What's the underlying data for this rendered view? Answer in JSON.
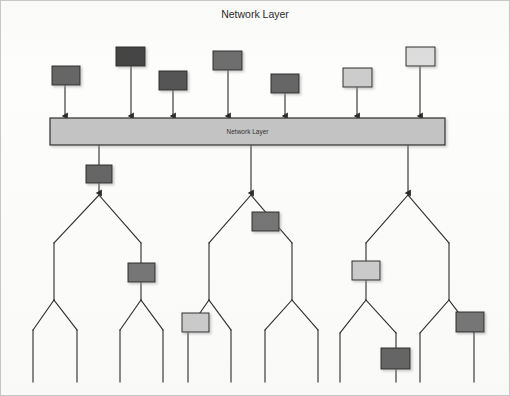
{
  "figure": {
    "title": "Network Layer",
    "type": "diagram",
    "width": 510,
    "height": 396,
    "background_color": "#fdfdfc",
    "line_color": "#2b2b2b"
  },
  "palette": {
    "darkest": "#444444",
    "dark": "#666666",
    "mid": "#7d7d7d",
    "light": "#cccccc",
    "lightest": "#dddddd",
    "bar_fill": "#c4c4c4"
  },
  "bar": {
    "label": "Network Layer",
    "x": 50,
    "y": 118,
    "width": 395,
    "height": 27,
    "fill": "#c4c4c4"
  },
  "incoming": {
    "count": 7,
    "description": "Packets arriving into the network layer",
    "nodes": [
      {
        "id": "in-1",
        "x": 52,
        "y": 66,
        "w": 28,
        "h": 19,
        "fill": "#666666",
        "arrow_x": 65,
        "arrow_to_y": 116
      },
      {
        "id": "in-2",
        "x": 116,
        "y": 47,
        "w": 29,
        "h": 19,
        "fill": "#444444",
        "arrow_x": 131,
        "arrow_to_y": 116
      },
      {
        "id": "in-3",
        "x": 159,
        "y": 71,
        "w": 28,
        "h": 19,
        "fill": "#555555",
        "arrow_x": 173,
        "arrow_to_y": 116
      },
      {
        "id": "in-4",
        "x": 213,
        "y": 51,
        "w": 29,
        "h": 19,
        "fill": "#6e6e6e",
        "arrow_x": 228,
        "arrow_to_y": 116
      },
      {
        "id": "in-5",
        "x": 271,
        "y": 74,
        "w": 28,
        "h": 19,
        "fill": "#666666",
        "arrow_x": 285,
        "arrow_to_y": 116
      },
      {
        "id": "in-6",
        "x": 343,
        "y": 68,
        "w": 29,
        "h": 19,
        "fill": "#cccccc",
        "arrow_x": 357,
        "arrow_to_y": 116
      },
      {
        "id": "in-7",
        "x": 406,
        "y": 47,
        "w": 29,
        "h": 19,
        "fill": "#dddddd",
        "arrow_x": 420,
        "arrow_to_y": 116
      }
    ]
  },
  "outgoing": {
    "count": 3,
    "description": "Three distribution trees fed from the network layer bar",
    "trunks": [
      {
        "id": "trunk-1",
        "x": 99,
        "from_y": 145,
        "to_y": 193
      },
      {
        "id": "trunk-2",
        "x": 251,
        "from_y": 145,
        "to_y": 193
      },
      {
        "id": "trunk-3",
        "x": 408,
        "from_y": 145,
        "to_y": 193
      }
    ],
    "trunk_nodes": [
      {
        "id": "trunk-node-1",
        "x": 86,
        "y": 165,
        "w": 26,
        "h": 18,
        "fill": "#666666"
      }
    ]
  },
  "trees": [
    {
      "id": "tree-1",
      "apex": {
        "x": 99,
        "y": 195
      },
      "branches": [
        {
          "from": [
            99,
            195
          ],
          "to": [
            54,
            243
          ]
        },
        {
          "from": [
            99,
            195
          ],
          "to": [
            141,
            243
          ]
        }
      ],
      "stems": [
        {
          "x": 54,
          "from_y": 243,
          "to_y": 300
        },
        {
          "x": 141,
          "from_y": 243,
          "to_y": 300
        }
      ],
      "forks": [
        {
          "from": [
            54,
            300
          ],
          "to": [
            33,
            330
          ],
          "leg_to_y": 382
        },
        {
          "from": [
            54,
            300
          ],
          "to": [
            77,
            330
          ],
          "leg_to_y": 382
        },
        {
          "from": [
            141,
            300
          ],
          "to": [
            120,
            330
          ],
          "leg_to_y": 382
        },
        {
          "from": [
            141,
            300
          ],
          "to": [
            163,
            330
          ],
          "leg_to_y": 382
        }
      ],
      "boxes": [
        {
          "id": "tree1-box-a",
          "x": 128,
          "y": 263,
          "w": 27,
          "h": 19,
          "fill": "#777777"
        }
      ]
    },
    {
      "id": "tree-2",
      "apex": {
        "x": 251,
        "y": 195
      },
      "branches": [
        {
          "from": [
            251,
            195
          ],
          "to": [
            209,
            243
          ]
        },
        {
          "from": [
            251,
            195
          ],
          "to": [
            292,
            243
          ]
        }
      ],
      "stems": [
        {
          "x": 209,
          "from_y": 243,
          "to_y": 300
        },
        {
          "x": 292,
          "from_y": 243,
          "to_y": 300
        }
      ],
      "forks": [
        {
          "from": [
            209,
            300
          ],
          "to": [
            188,
            330
          ],
          "leg_to_y": 382
        },
        {
          "from": [
            209,
            300
          ],
          "to": [
            231,
            330
          ],
          "leg_to_y": 382
        },
        {
          "from": [
            292,
            300
          ],
          "to": [
            265,
            330
          ],
          "leg_to_y": 382
        },
        {
          "from": [
            292,
            300
          ],
          "to": [
            318,
            330
          ],
          "leg_to_y": 382
        }
      ],
      "boxes": [
        {
          "id": "tree2-box-a",
          "x": 252,
          "y": 212,
          "w": 27,
          "h": 19,
          "fill": "#767676"
        },
        {
          "id": "tree2-box-b",
          "x": 182,
          "y": 313,
          "w": 27,
          "h": 19,
          "fill": "#cccccc"
        }
      ]
    },
    {
      "id": "tree-3",
      "apex": {
        "x": 408,
        "y": 195
      },
      "branches": [
        {
          "from": [
            408,
            195
          ],
          "to": [
            366,
            243
          ]
        },
        {
          "from": [
            408,
            195
          ],
          "to": [
            449,
            243
          ]
        }
      ],
      "stems": [
        {
          "x": 366,
          "from_y": 243,
          "to_y": 300
        },
        {
          "x": 449,
          "from_y": 243,
          "to_y": 300
        }
      ],
      "forks": [
        {
          "from": [
            366,
            300
          ],
          "to": [
            340,
            333
          ],
          "leg_to_y": 382
        },
        {
          "from": [
            366,
            300
          ],
          "to": [
            396,
            333
          ],
          "leg_to_y": 382
        },
        {
          "from": [
            449,
            300
          ],
          "to": [
            420,
            333
          ],
          "leg_to_y": 382
        },
        {
          "from": [
            449,
            300
          ],
          "to": [
            474,
            333
          ],
          "leg_to_y": 382
        }
      ],
      "boxes": [
        {
          "id": "tree3-box-a",
          "x": 352,
          "y": 261,
          "w": 28,
          "h": 19,
          "fill": "#cccccc"
        },
        {
          "id": "tree3-box-b",
          "x": 456,
          "y": 312,
          "w": 28,
          "h": 20,
          "fill": "#777777"
        },
        {
          "id": "tree3-box-c",
          "x": 381,
          "y": 348,
          "w": 29,
          "h": 21,
          "fill": "#666666"
        }
      ]
    }
  ]
}
